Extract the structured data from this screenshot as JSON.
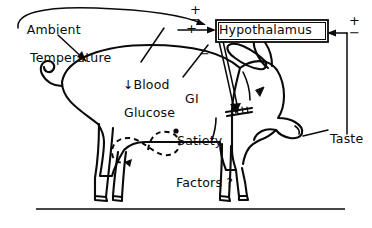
{
  "figure": {
    "type": "diagram",
    "baseline_rule": true,
    "labels": {
      "ambient_temperature": {
        "line1": "Ambient",
        "line2": "Temperature"
      },
      "blood_glucose": {
        "line1": "↓Blood",
        "line2": "Glucose"
      },
      "gi_satiety": {
        "line1": "GI",
        "line2": "Satiety",
        "line3": "Factors ?"
      },
      "hypothalamus": "Hypothalamus",
      "taste": "Taste"
    },
    "signs": {
      "ambient_positive": "+",
      "ambient_negative": "−",
      "blood_glucose_positive": "+",
      "gi_satiety_negative": "−",
      "taste_positive": "+",
      "taste_negative": "−"
    },
    "colors": {
      "ink": "#0a0a0a",
      "background": "#ffffff"
    }
  }
}
